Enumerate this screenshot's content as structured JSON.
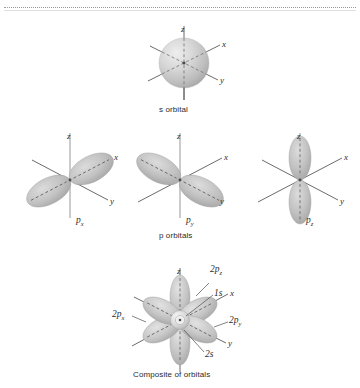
{
  "figure": {
    "background_color": "#ffffff",
    "lobe_fill_light": "#d2d2d2",
    "lobe_fill_dark": "#a8a8a8",
    "axis_color": "#5a5a5a",
    "text_color": "#2b2b2b"
  },
  "panels": [
    {
      "id": "s-orbital",
      "caption": "s orbital",
      "axis_labels": {
        "x": "x",
        "y": "y",
        "z": "z"
      }
    },
    {
      "id": "p-x-orbital",
      "label_base": "p",
      "label_sub": "x",
      "axis_labels": {
        "x": "x",
        "y": "y",
        "z": "z"
      }
    },
    {
      "id": "p-y-orbital",
      "label_base": "p",
      "label_sub": "y",
      "axis_labels": {
        "x": "x",
        "y": "y",
        "z": "z"
      }
    },
    {
      "id": "p-z-orbital",
      "label_base": "p",
      "label_sub": "z",
      "axis_labels": {
        "x": "x",
        "y": "y",
        "z": "z"
      }
    },
    {
      "id": "composite-orbital",
      "caption": "Composite of orbitals",
      "axis_labels": {
        "x": "x",
        "y": "y",
        "z": "z"
      }
    }
  ],
  "captions": {
    "s_orbital": "s orbital",
    "p_orbitals": "p orbitals",
    "composite": "Composite of orbitals"
  },
  "composite_labels": [
    {
      "base": "2p",
      "sub": "z"
    },
    {
      "base": "1s",
      "sub": ""
    },
    {
      "base": "2p",
      "sub": "x"
    },
    {
      "base": "2p",
      "sub": "y"
    },
    {
      "base": "2s",
      "sub": ""
    }
  ],
  "composite_label_text": {
    "two_p_z_base": "2p",
    "two_p_z_sub": "z",
    "one_s": "1s",
    "two_p_x_base": "2p",
    "two_p_x_sub": "x",
    "two_p_y_base": "2p",
    "two_p_y_sub": "y",
    "two_s": "2s"
  },
  "p_labels": {
    "px_base": "p",
    "px_sub": "x",
    "py_base": "p",
    "py_sub": "y",
    "pz_base": "p",
    "pz_sub": "z"
  },
  "axis_text": {
    "x": "x",
    "y": "y",
    "z": "z"
  }
}
